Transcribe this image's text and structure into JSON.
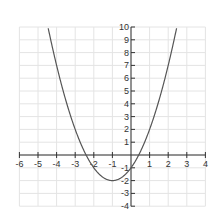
{
  "chart_data": {
    "type": "line",
    "title": "",
    "xlabel": "",
    "ylabel": "",
    "xlim": [
      -6,
      4
    ],
    "ylim": [
      -4,
      10
    ],
    "grid": true,
    "x_ticks": [
      -6,
      -5,
      -4,
      -3,
      -2,
      -1,
      1,
      2,
      3,
      4
    ],
    "y_ticks": [
      10,
      9,
      8,
      7,
      6,
      5,
      4,
      3,
      2,
      1,
      -1,
      -2,
      -3,
      -4
    ],
    "series": [
      {
        "name": "y = x^2 + 2x - 1",
        "function": "x^2 + 2x - 1",
        "vertex": [
          -1,
          -2
        ],
        "y_intercept": -1,
        "x_intercepts": [
          -2.414,
          0.414
        ],
        "x": [
          -4.45,
          -4,
          -3.5,
          -3,
          -2.5,
          -2,
          -1.5,
          -1,
          -0.5,
          0,
          0.5,
          1,
          1.5,
          2,
          2.45
        ],
        "values": [
          9.9,
          7,
          4.25,
          2,
          0.25,
          -1,
          -1.75,
          -2,
          -1.75,
          -1,
          0.25,
          2,
          4.25,
          7,
          9.9
        ]
      }
    ]
  },
  "colors": {
    "curve": "#555555",
    "axis": "#333333",
    "grid": "#e4e4e4"
  }
}
